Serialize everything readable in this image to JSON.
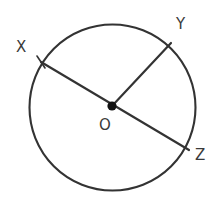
{
  "figure": {
    "kind": "geometry-circle-diagram",
    "canvas": {
      "width": 221,
      "height": 201,
      "background": "#ffffff"
    },
    "stroke_color": "#333333",
    "stroke_width": 2,
    "point_color": "#111111",
    "label_color": "#3a3a3a"
  },
  "chart_data": {
    "type": "diagram",
    "title": "",
    "shape": "circle",
    "circle": {
      "center": {
        "x": 112.5,
        "y": 107.5
      },
      "radius": 83,
      "label": "O"
    },
    "points": [
      {
        "name": "X",
        "x": 41,
        "y": 62,
        "label": "X",
        "on_circle": true
      },
      {
        "name": "Y",
        "x": 171,
        "y": 43,
        "label": "Y",
        "on_circle": true
      },
      {
        "name": "Z",
        "x": 189,
        "y": 150,
        "label": "Z",
        "on_circle": true
      },
      {
        "name": "O",
        "x": 112,
        "y": 106,
        "label": "O",
        "on_circle": false,
        "is_center": true
      }
    ],
    "segments": [
      {
        "name": "XZ",
        "from": "X",
        "to": "Z",
        "kind": "diameter"
      },
      {
        "name": "OY",
        "from": "O",
        "to": "Y",
        "kind": "radius"
      }
    ],
    "label_positions": {
      "X": {
        "x": 16,
        "y": 40
      },
      "Y": {
        "x": 176,
        "y": 17
      },
      "Z": {
        "x": 195,
        "y": 148
      },
      "O": {
        "x": 99,
        "y": 118
      }
    }
  },
  "labels": {
    "x": "X",
    "y": "Y",
    "z": "Z",
    "o": "O"
  }
}
